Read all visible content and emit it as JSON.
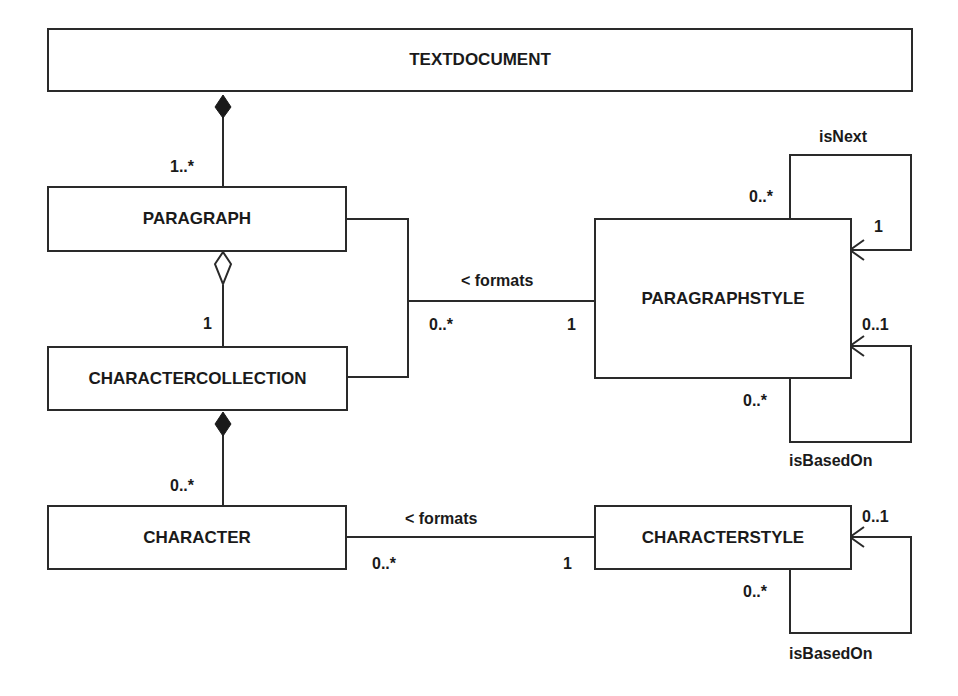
{
  "classes": {
    "textdocument": "TEXTDOCUMENT",
    "paragraph": "PARAGRAPH",
    "charactercollection": "CHARACTERCOLLECTION",
    "character": "CHARACTER",
    "paragraphstyle": "PARAGRAPHSTYLE",
    "characterstyle": "CHARACTERSTYLE"
  },
  "relations": {
    "doc_para": {
      "type": "composition",
      "multiplicity": "1..*"
    },
    "para_coll": {
      "type": "aggregation",
      "multiplicity": "1"
    },
    "coll_char": {
      "type": "composition",
      "multiplicity": "0..*"
    },
    "para_style": {
      "label": "< formats",
      "source_mult": "0..*",
      "target_mult": "1"
    },
    "char_style": {
      "label": "< formats",
      "source_mult": "0..*",
      "target_mult": "1"
    },
    "pstyle_isnext": {
      "label": "isNext",
      "source_mult": "0..*",
      "target_mult": "1"
    },
    "pstyle_isbasedon": {
      "label": "isBasedOn",
      "source_mult": "0..*",
      "target_mult": "0..1"
    },
    "cstyle_isbasedon": {
      "label": "isBasedOn",
      "source_mult": "0..*",
      "target_mult": "0..1"
    }
  }
}
